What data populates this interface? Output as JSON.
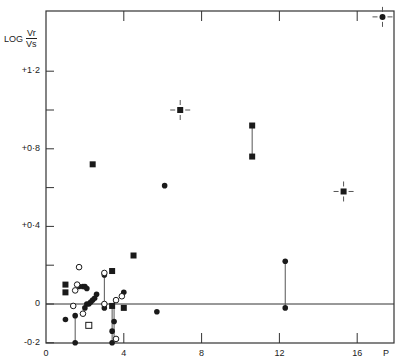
{
  "chart_data": {
    "type": "scatter",
    "title": "",
    "xlabel": "P",
    "ylabel": "LOG Vr/Vs",
    "ylabel_parts": {
      "prefix": "LOG",
      "numerator": "Vr",
      "denominator": "Vs"
    },
    "xlim": [
      0,
      17.8
    ],
    "ylim": [
      -0.2,
      1.49
    ],
    "x_ticks": [
      0,
      4,
      8,
      12,
      16
    ],
    "x_tick_labels": [
      "0",
      "4",
      "8",
      "12",
      "16"
    ],
    "y_ticks": [
      -0.2,
      0,
      0.4,
      0.8,
      1.2
    ],
    "y_tick_labels": [
      "-0·2",
      "0",
      "+0·4",
      "+0·8",
      "+1·2"
    ],
    "y_minor_ticks": [
      0.2,
      0.6,
      1.0
    ],
    "x_minor_ticks": [
      2,
      6,
      10,
      14
    ],
    "grid": false,
    "reference_line_y": 0,
    "series": [
      {
        "name": "filled-circle",
        "marker": "filled-circle",
        "points": [
          [
            1.0,
            -0.08
          ],
          [
            1.5,
            -0.2
          ],
          [
            1.5,
            -0.06
          ],
          [
            1.7,
            0.09
          ],
          [
            1.9,
            0.09
          ],
          [
            2.0,
            0.09
          ],
          [
            2.1,
            0.08
          ],
          [
            2.0,
            -0.02
          ],
          [
            2.1,
            0.0
          ],
          [
            2.2,
            0.0
          ],
          [
            2.3,
            0.01
          ],
          [
            2.4,
            0.02
          ],
          [
            2.5,
            0.03
          ],
          [
            2.6,
            0.05
          ],
          [
            3.0,
            0.15
          ],
          [
            3.0,
            -0.02
          ],
          [
            3.4,
            -0.2
          ],
          [
            3.4,
            -0.14
          ],
          [
            3.5,
            -0.09
          ],
          [
            4.0,
            0.06
          ],
          [
            5.7,
            -0.04
          ],
          [
            6.1,
            0.61
          ],
          [
            12.3,
            0.22
          ],
          [
            12.3,
            -0.02
          ]
        ]
      },
      {
        "name": "open-circle",
        "marker": "open-circle",
        "points": [
          [
            1.7,
            0.19
          ],
          [
            1.6,
            0.1
          ],
          [
            1.5,
            0.07
          ],
          [
            1.4,
            -0.01
          ],
          [
            1.9,
            -0.05
          ],
          [
            3.0,
            0.16
          ],
          [
            3.0,
            0.0
          ],
          [
            3.6,
            0.02
          ],
          [
            3.6,
            -0.18
          ],
          [
            3.9,
            0.04
          ]
        ]
      },
      {
        "name": "filled-square",
        "marker": "filled-square",
        "points": [
          [
            1.0,
            0.1
          ],
          [
            1.0,
            0.06
          ],
          [
            2.4,
            0.72
          ],
          [
            3.4,
            0.17
          ],
          [
            3.4,
            -0.01
          ],
          [
            4.0,
            -0.02
          ],
          [
            4.5,
            0.25
          ],
          [
            10.6,
            0.92
          ],
          [
            10.6,
            0.76
          ]
        ]
      },
      {
        "name": "open-square",
        "marker": "open-square",
        "points": [
          [
            2.2,
            -0.11
          ]
        ]
      },
      {
        "name": "square-with-error-cross",
        "marker": "filled-square-cross",
        "points": [
          [
            6.9,
            1.0
          ],
          [
            15.3,
            0.58
          ]
        ]
      },
      {
        "name": "circle-with-error-cross",
        "marker": "filled-circle-cross",
        "points": [
          [
            17.3,
            1.48
          ]
        ]
      }
    ],
    "connectors": [
      [
        [
          1.5,
          -0.06
        ],
        [
          1.5,
          -0.2
        ]
      ],
      [
        [
          3.0,
          0.16
        ],
        [
          3.0,
          -0.02
        ]
      ],
      [
        [
          3.5,
          0.02
        ],
        [
          3.5,
          -0.18
        ]
      ],
      [
        [
          3.4,
          -0.01
        ],
        [
          3.4,
          -0.2
        ]
      ],
      [
        [
          10.6,
          0.92
        ],
        [
          10.6,
          0.76
        ]
      ],
      [
        [
          12.3,
          0.22
        ],
        [
          12.3,
          -0.02
        ]
      ]
    ],
    "legend": null
  },
  "axis": {
    "ylabel_prefix": "LOG",
    "ylabel_num": "Vr",
    "ylabel_den": "Vs",
    "xlabel": "P"
  },
  "colors": {
    "ink": "#1a1a1a",
    "axis": "#333333",
    "connector": "#555555",
    "background": "#ffffff"
  }
}
